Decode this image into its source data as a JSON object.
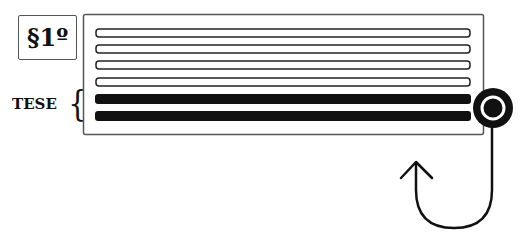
{
  "diagram": {
    "section_label": "§1º",
    "bracket_label": "TESE",
    "document": {
      "x": 83,
      "y": 14,
      "width": 400,
      "height": 120,
      "lines": [
        {
          "y": 33,
          "style": "outline"
        },
        {
          "y": 49,
          "style": "outline"
        },
        {
          "y": 65,
          "style": "outline"
        },
        {
          "y": 82,
          "style": "outline"
        },
        {
          "y": 99,
          "style": "filled",
          "bracketed": true
        },
        {
          "y": 116,
          "style": "filled",
          "bracketed": true
        }
      ]
    },
    "marker": {
      "shape": "circle-target",
      "cx": 493,
      "cy": 108
    },
    "arrow": {
      "shape": "u-turn-arrow",
      "direction": "up"
    },
    "colors": {
      "ink": "#111111",
      "border": "#555555",
      "background": "#ffffff"
    }
  }
}
